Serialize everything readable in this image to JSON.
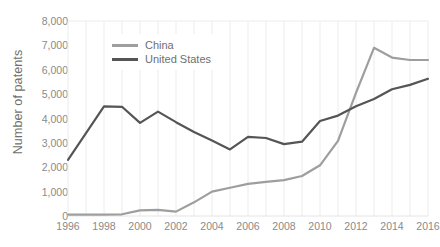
{
  "chart": {
    "type": "line",
    "ylabel": "Number of patents",
    "xlabel": "",
    "title": "",
    "legend_position": "top-left-inside",
    "grid": "light vertical gridlines at every year; horizontal gridline at top (8,000)",
    "colors": {
      "china_line": "#9e9e9e",
      "united_states_line": "#555555",
      "gridline": "#ececec",
      "axis_text": "#8a8a8a",
      "axis_title": "#6f6f6f",
      "background": "#ffffff"
    }
  },
  "chart_data": {
    "type": "line",
    "title": "",
    "xlabel": "",
    "ylabel": "Number of patents",
    "xlim": [
      1996,
      2016
    ],
    "ylim": [
      0,
      8000
    ],
    "grid": true,
    "legend_position": "top-left-inside",
    "x": [
      1996,
      1997,
      1998,
      1999,
      2000,
      2001,
      2002,
      2003,
      2004,
      2005,
      2006,
      2007,
      2008,
      2009,
      2010,
      2011,
      2012,
      2013,
      2014,
      2015,
      2016
    ],
    "x_tick_labels": [
      "1996",
      "1998",
      "2000",
      "2002",
      "2004",
      "2006",
      "2008",
      "2010",
      "2012",
      "2014",
      "2016"
    ],
    "y_tick_labels": [
      "0",
      "1,000",
      "2,000",
      "3,000",
      "4,000",
      "5,000",
      "6,000",
      "7,000",
      "8,000"
    ],
    "y_tick_values": [
      0,
      1000,
      2000,
      3000,
      4000,
      5000,
      6000,
      7000,
      8000
    ],
    "series": [
      {
        "name": "China",
        "color": "#9e9e9e",
        "values": [
          60,
          60,
          60,
          70,
          230,
          250,
          180,
          560,
          1000,
          1160,
          1320,
          1400,
          1470,
          1640,
          2080,
          3080,
          5050,
          6900,
          6500,
          6400,
          6400
        ]
      },
      {
        "name": "United States",
        "color": "#555555",
        "values": [
          2300,
          3400,
          4500,
          4480,
          3820,
          4280,
          3850,
          3450,
          3100,
          2730,
          3250,
          3200,
          2950,
          3050,
          3900,
          4120,
          4500,
          4800,
          5200,
          5380,
          5630
        ]
      }
    ]
  },
  "legend": {
    "items": [
      {
        "label": "China",
        "color": "#9e9e9e"
      },
      {
        "label": "United States",
        "color": "#555555"
      }
    ]
  },
  "bottom_artifact": {
    "text": ""
  }
}
